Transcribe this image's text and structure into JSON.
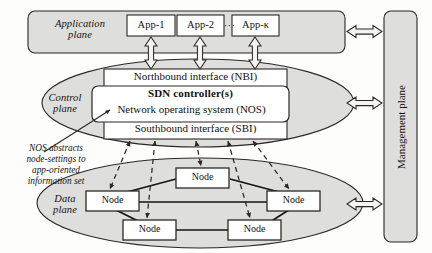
{
  "figure": {
    "colors": {
      "fill_plane": "#dededd",
      "fill_box": "#ffffff",
      "stroke": "#2b2724",
      "text": "#15120f",
      "arrow_fill": "#f4f4f3",
      "background": "#fdfdfc"
    }
  },
  "application_plane": {
    "label": "Application\nplane",
    "apps": [
      {
        "label": "App-1"
      },
      {
        "label": "App-2"
      },
      {
        "label": "App-κ"
      }
    ],
    "ellipsis": "···"
  },
  "control_plane": {
    "label": "Control\nplane",
    "northbound": "Northbound interface (NBI)",
    "controller_title": "SDN controller(s)",
    "nos": "Network operating system (NOS)",
    "southbound": "Southbound interface (SBI)"
  },
  "annotation": {
    "text": "NOS abstracts\nnode-settings to\napp-oriented\ninformation set"
  },
  "data_plane": {
    "label": "Data\nplane",
    "nodes": [
      {
        "id": "node-top",
        "label": "Node"
      },
      {
        "id": "node-left",
        "label": "Node"
      },
      {
        "id": "node-right",
        "label": "Node"
      },
      {
        "id": "node-bottom-left",
        "label": "Node"
      },
      {
        "id": "node-bottom-right",
        "label": "Node"
      }
    ]
  },
  "management_plane": {
    "label": "Management plane"
  }
}
